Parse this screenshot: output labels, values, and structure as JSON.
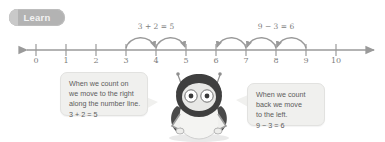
{
  "badge": {
    "label": "Learn"
  },
  "number_line": {
    "min": 0,
    "max": 10,
    "ticks": [
      "0",
      "1",
      "2",
      "3",
      "4",
      "5",
      "6",
      "7",
      "8",
      "9",
      "10"
    ],
    "left_arrowhead": true,
    "right_arrowhead": true,
    "line_color": "#9a9a9a"
  },
  "jumps": [
    {
      "equation": "3 + 2 = 5",
      "direction": "right",
      "from": 3,
      "to": 5,
      "hops": [
        [
          3,
          4
        ],
        [
          4,
          5
        ]
      ],
      "label_center": 4
    },
    {
      "equation": "9 − 3 = 6",
      "direction": "left",
      "from": 9,
      "to": 6,
      "hops": [
        [
          9,
          8
        ],
        [
          8,
          7
        ],
        [
          7,
          6
        ]
      ],
      "label_center": 7.5
    }
  ],
  "bubbles": {
    "left": {
      "lines": [
        "When we count on",
        "we move to the right",
        "along the number line.",
        "3 + 2 = 5"
      ]
    },
    "right": {
      "lines": [
        "When we count",
        "back we move",
        "to the left.",
        "9 − 3 = 6"
      ]
    }
  },
  "character": {
    "name": "penguin-robot-mascot"
  },
  "colors": {
    "badge_bg": "#b3b3b3",
    "badge_text": "#f2f2f2",
    "line": "#9a9a9a",
    "bubble_bg": "#f0f0ee",
    "text": "#5c5c5c"
  }
}
